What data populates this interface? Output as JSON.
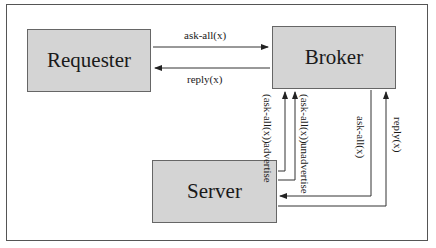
{
  "diagram": {
    "nodes": [
      {
        "id": "requester",
        "label": "Requester"
      },
      {
        "id": "broker",
        "label": "Broker"
      },
      {
        "id": "server",
        "label": "Server"
      }
    ],
    "edges": [
      {
        "from": "requester",
        "to": "broker",
        "label": "ask-all(x)"
      },
      {
        "from": "broker",
        "to": "requester",
        "label": "reply(x)"
      },
      {
        "from": "server",
        "to": "broker",
        "label_line1": "advertise",
        "label_line2": "(ask-all(x))"
      },
      {
        "from": "server",
        "to": "broker",
        "label_line1": "unadvertise",
        "label_line2": "(ask-all(x))"
      },
      {
        "from": "broker",
        "to": "server",
        "label": "ask-all(x)"
      },
      {
        "from": "server",
        "to": "broker",
        "label": "reply(x)"
      }
    ],
    "colors": {
      "box_fill": "#d4d4d4",
      "line": "#333333"
    }
  }
}
